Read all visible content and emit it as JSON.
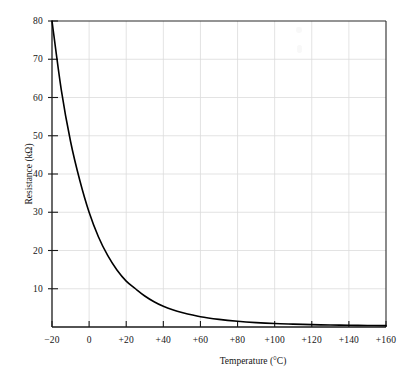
{
  "chart_data": {
    "type": "line",
    "title": "",
    "xlabel": "Temperature (°C)",
    "ylabel": "Resistance (kΩ)",
    "xlim": [
      -20,
      160
    ],
    "ylim": [
      0,
      80
    ],
    "grid": true,
    "legend": "none",
    "x_ticks": [
      -20,
      0,
      20,
      40,
      60,
      80,
      100,
      120,
      140,
      160
    ],
    "x_tick_labels": [
      "−20",
      "0",
      "+20",
      "+40",
      "+60",
      "+80",
      "+100",
      "+120",
      "+140",
      "+160"
    ],
    "y_ticks": [
      10,
      20,
      30,
      40,
      50,
      60,
      70,
      80
    ],
    "y_tick_labels": [
      "10",
      "20",
      "30",
      "40",
      "50",
      "60",
      "70",
      "80"
    ],
    "series": [
      {
        "name": "NTC thermistor resistance",
        "color": "#000000",
        "x": [
          -20,
          -15,
          -10,
          -5,
          0,
          5,
          10,
          15,
          20,
          25,
          30,
          35,
          40,
          45,
          50,
          60,
          70,
          80,
          90,
          100,
          110,
          120,
          130,
          140,
          150,
          160
        ],
        "y": [
          80.0,
          62.0,
          48.5,
          38.3,
          30.0,
          23.6,
          18.7,
          14.9,
          12.0,
          10.0,
          8.1,
          6.6,
          5.4,
          4.5,
          3.8,
          2.7,
          2.0,
          1.5,
          1.15,
          0.9,
          0.75,
          0.62,
          0.52,
          0.45,
          0.4,
          0.35
        ]
      }
    ]
  },
  "axes": {
    "x_title": "Temperature (°C)",
    "y_title": "Resistance (kΩ)"
  },
  "style": {
    "curve_color": "#000000",
    "axis_color": "#1a1a1a",
    "grid_color": "#dcdcdc",
    "background": "#ffffff",
    "text_color": "#141414"
  }
}
